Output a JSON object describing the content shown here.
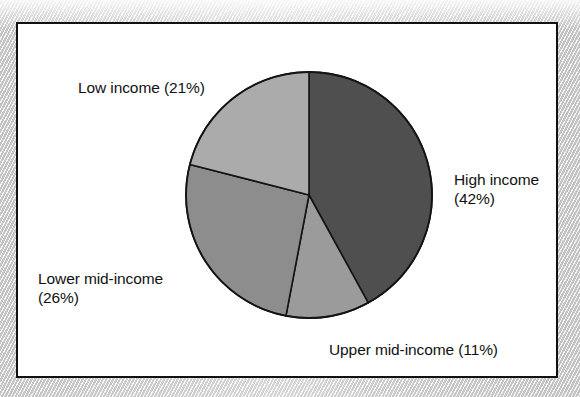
{
  "chart_data": {
    "type": "pie",
    "title": "",
    "subtitle": "",
    "xlabel": "",
    "ylabel": "",
    "legend_position": "none",
    "grid": false,
    "start_angle_deg": 0,
    "direction": "clockwise",
    "categories": [
      "High income",
      "Upper mid-income",
      "Lower mid-income",
      "Low income"
    ],
    "values": [
      42,
      26,
      11,
      21
    ],
    "unit": "%",
    "slices": [
      {
        "name": "High income",
        "value": 42,
        "label": "High income\n(42%)",
        "label_lines": [
          "High income",
          "(42%)"
        ],
        "color": "#4f4f4f",
        "start_pct": 0,
        "end_pct": 42
      },
      {
        "name": "Upper mid-income",
        "value": 11,
        "label": "Upper mid-income (11%)",
        "label_lines": [
          "Upper mid-income (11%)"
        ],
        "color": "#9b9b9b",
        "start_pct": 42,
        "end_pct": 53
      },
      {
        "name": "Lower mid-income",
        "value": 26,
        "label": "Lower mid-income\n(26%)",
        "label_lines": [
          "Lower mid-income",
          "(26%)"
        ],
        "color": "#8d8d8d",
        "start_pct": 53,
        "end_pct": 79
      },
      {
        "name": "Low income",
        "value": 21,
        "label": "Low income (21%)",
        "label_lines": [
          "Low income (21%)"
        ],
        "color": "#ababab",
        "start_pct": 79,
        "end_pct": 100
      }
    ],
    "colors": {
      "high_income": "#4f4f4f",
      "upper_mid_income": "#9b9b9b",
      "lower_mid_income": "#8d8d8d",
      "low_income": "#ababab",
      "slice_outline": "#141414",
      "frame_border": "#111111",
      "chart_background": "#ffffff",
      "text": "#121212"
    }
  },
  "geometry": {
    "center_x": 291,
    "center_y": 171,
    "radius": 123
  }
}
